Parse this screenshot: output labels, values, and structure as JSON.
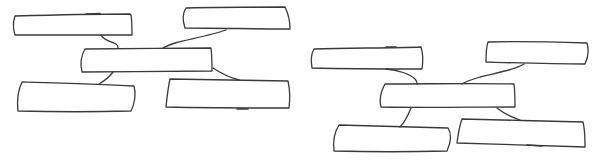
{
  "canvas": {
    "width": 600,
    "height": 160,
    "background": "#ffffff"
  },
  "style": {
    "stroke_color": "#3a3a3a",
    "stroke_width": 1.3
  },
  "diagrams": [
    {
      "name": "mind-map-sketch-left",
      "central_box": {
        "label": ""
      },
      "boxes": [
        {
          "position": "top-left",
          "label": ""
        },
        {
          "position": "top-right",
          "label": ""
        },
        {
          "position": "bottom-left",
          "label": ""
        },
        {
          "position": "bottom-right",
          "label": ""
        }
      ]
    },
    {
      "name": "mind-map-sketch-right",
      "central_box": {
        "label": ""
      },
      "boxes": [
        {
          "position": "top-left",
          "label": ""
        },
        {
          "position": "top-right",
          "label": ""
        },
        {
          "position": "bottom-left",
          "label": ""
        },
        {
          "position": "bottom-right",
          "label": ""
        }
      ]
    }
  ]
}
